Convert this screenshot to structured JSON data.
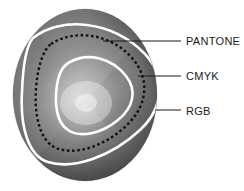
{
  "diagram": {
    "background_color": "#ffffff",
    "sphere": {
      "name": "color-space-sphere",
      "center_x": 85,
      "center_y": 95,
      "radius_x": 72,
      "radius_y": 86,
      "highlight_x": 86,
      "highlight_y": 103,
      "colors": {
        "highlight": "#f2f2f2",
        "mid": "#9a9a9a",
        "dark": "#3d3d3d",
        "edge": "#6b6b6b"
      }
    },
    "gamuts": [
      {
        "id": "pantone",
        "label": "PANTONE",
        "style": "dashed",
        "color": "#121212",
        "label_x": 186,
        "label_y": 45,
        "leader_from_x": 103,
        "leader_from_y": 41,
        "leader_to_x": 181,
        "leader_to_y": 41
      },
      {
        "id": "cmyk",
        "label": "CMYK",
        "style": "solid-white",
        "color": "#ffffff",
        "label_x": 186,
        "label_y": 80,
        "leader_from_x": 138,
        "leader_from_y": 76,
        "leader_to_x": 181,
        "leader_to_y": 76
      },
      {
        "id": "rgb",
        "label": "RGB",
        "style": "solid-white",
        "color": "#ffffff",
        "label_x": 186,
        "label_y": 115,
        "leader_from_x": 155,
        "leader_from_y": 110,
        "leader_to_x": 181,
        "leader_to_y": 110
      }
    ]
  }
}
